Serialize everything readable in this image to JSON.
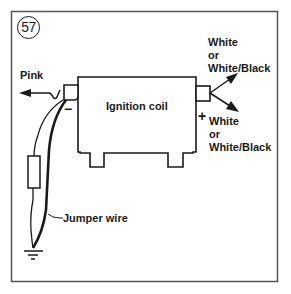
{
  "figure": {
    "number": "57",
    "border_color": "#555555",
    "line_color": "#1a1a1a"
  },
  "component": {
    "label": "Ignition coil"
  },
  "terminals": {
    "negative": {
      "symbol": "−",
      "wire_label": "Pink"
    },
    "positive": {
      "symbol": "+"
    }
  },
  "wires": {
    "upper_right": {
      "line1": "White",
      "line2": "or",
      "line3": "White/Black"
    },
    "lower_right": {
      "line1": "White",
      "line2": "or",
      "line3": "White/Black"
    },
    "jumper": {
      "label": "Jumper wire"
    }
  },
  "symbols": {
    "resistor": "resistor-icon",
    "ground": "ground-icon",
    "arrows": "arrow-icon"
  }
}
